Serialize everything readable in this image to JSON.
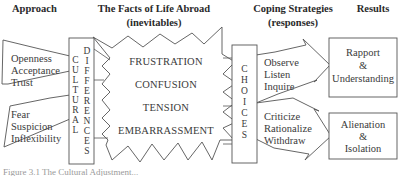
{
  "headers": {
    "approach": "Approach",
    "facts_line1": "The Facts of Life Abroad",
    "facts_line2": "(inevitables)",
    "coping_line1": "Coping Strategies",
    "coping_line2": "(responses)",
    "results": "Results"
  },
  "approach": {
    "positive": [
      "Openness",
      "Acceptance",
      "Trust"
    ],
    "negative": [
      "Fear",
      "Suspicion",
      "Inflexibility"
    ]
  },
  "cultural_differences": {
    "col1": [
      "C",
      "U",
      "L",
      "T",
      "U",
      "R",
      "A",
      "L"
    ],
    "col2": [
      "D",
      "I",
      "F",
      "F",
      "E",
      "R",
      "E",
      "N",
      "C",
      "E",
      "S"
    ]
  },
  "facts": [
    "FRUSTRATION",
    "CONFUSION",
    "TENSION",
    "EMBARRASSMENT"
  ],
  "choices": [
    "C",
    "H",
    "O",
    "I",
    "C",
    "E",
    "S"
  ],
  "coping": {
    "positive": [
      "Observe",
      "Listen",
      "Inquire"
    ],
    "negative": [
      "Criticize",
      "Rationalize",
      "Withdraw"
    ]
  },
  "results": {
    "positive": [
      "Rapport",
      "&",
      "Understanding"
    ],
    "negative": [
      "Alienation",
      "&",
      "Isolation"
    ]
  },
  "caption": "Figure 3.1 The Cultural Adjustment..."
}
